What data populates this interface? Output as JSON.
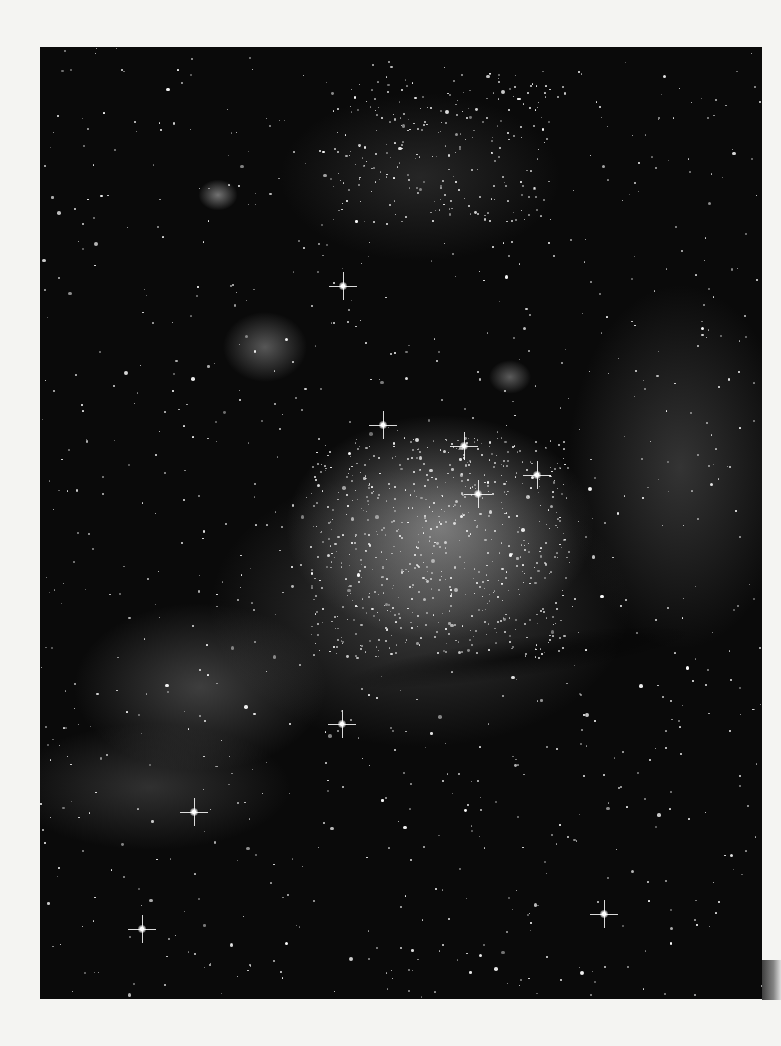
{
  "image": {
    "subject": "star-field-with-nebula",
    "colors": {
      "page_background": "#f4f4f2",
      "sky": "#0a0a0a",
      "star": "#ffffff"
    },
    "bright_stars": [
      {
        "x": 343,
        "y": 286
      },
      {
        "x": 383,
        "y": 425
      },
      {
        "x": 464,
        "y": 446
      },
      {
        "x": 537,
        "y": 475
      },
      {
        "x": 478,
        "y": 494
      },
      {
        "x": 342,
        "y": 724
      },
      {
        "x": 142,
        "y": 929
      },
      {
        "x": 604,
        "y": 914
      },
      {
        "x": 194,
        "y": 812
      }
    ]
  }
}
